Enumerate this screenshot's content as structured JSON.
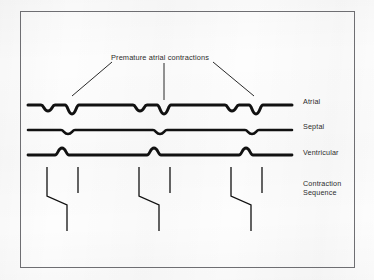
{
  "figure": {
    "kind": "cardiac-contraction-sequence-diagram",
    "callout_label": "Premature atrial contractions",
    "frame_color": "#6e6e72",
    "trace_color": "#111111",
    "background_color": "#fdfdfd",
    "text_color": "#2b2b2b"
  },
  "traces": [
    {
      "id": "atrial",
      "label": "Atrial",
      "baseline_y": 105,
      "stroke_width": 3.0,
      "deflection_direction": "down",
      "description": "Three beat groups; each group has a shallow normal atrial deflection followed by a deeper premature atrial contraction.",
      "events": [
        {
          "x": 48,
          "depth": 6,
          "type": "normal"
        },
        {
          "x": 72,
          "depth": 9,
          "type": "premature"
        },
        {
          "x": 140,
          "depth": 6,
          "type": "normal"
        },
        {
          "x": 164,
          "depth": 9,
          "type": "premature"
        },
        {
          "x": 232,
          "depth": 6,
          "type": "normal"
        },
        {
          "x": 256,
          "depth": 9,
          "type": "premature"
        }
      ]
    },
    {
      "id": "septal",
      "label": "Septal",
      "baseline_y": 130,
      "stroke_width": 2.6,
      "deflection_direction": "down",
      "description": "One small downward deflection per beat group.",
      "events": [
        {
          "x": 68,
          "depth": 4,
          "type": "normal"
        },
        {
          "x": 160,
          "depth": 4,
          "type": "normal"
        },
        {
          "x": 252,
          "depth": 4,
          "type": "normal"
        }
      ]
    },
    {
      "id": "ventricular",
      "label": "Ventricular",
      "baseline_y": 155,
      "stroke_width": 2.8,
      "deflection_direction": "up",
      "description": "One upward deflection per beat group.",
      "events": [
        {
          "x": 62,
          "depth": 7,
          "type": "normal"
        },
        {
          "x": 154,
          "depth": 7,
          "type": "normal"
        },
        {
          "x": 246,
          "depth": 7,
          "type": "normal"
        }
      ]
    }
  ],
  "callout_leaders": [
    {
      "id": "leader-left",
      "x1": 112,
      "y1": 62,
      "x2": 72,
      "y2": 96
    },
    {
      "id": "leader-middle",
      "x1": 164,
      "y1": 63,
      "x2": 164,
      "y2": 100
    },
    {
      "id": "leader-right",
      "x1": 213,
      "y1": 62,
      "x2": 254,
      "y2": 96
    }
  ],
  "contraction_sequence": {
    "label_line1": "Contraction",
    "label_line2": "Sequence",
    "stroke_width": 1.3,
    "description": "Three repeated groups. Each group has a kinked conduction line (down, slanting right, then down) and a shorter straight vertical line.",
    "groups": [
      {
        "id": "group-1",
        "kinked": {
          "x_top": 47,
          "y_top": 167,
          "y_bend_start": 196,
          "x_bottom": 67,
          "y_bend_end": 205,
          "y_bottom": 231
        },
        "straight": {
          "x": 78,
          "y_top": 167,
          "y_bottom": 193
        }
      },
      {
        "id": "group-2",
        "kinked": {
          "x_top": 139,
          "y_top": 167,
          "y_bend_start": 196,
          "x_bottom": 159,
          "y_bend_end": 205,
          "y_bottom": 231
        },
        "straight": {
          "x": 170,
          "y_top": 167,
          "y_bottom": 193
        }
      },
      {
        "id": "group-3",
        "kinked": {
          "x_top": 231,
          "y_top": 167,
          "y_bend_start": 196,
          "x_bottom": 251,
          "y_bend_end": 205,
          "y_bottom": 231
        },
        "straight": {
          "x": 262,
          "y_top": 167,
          "y_bottom": 193
        }
      }
    ]
  },
  "axis": {
    "trace_x_start": 28,
    "trace_x_end": 292
  }
}
